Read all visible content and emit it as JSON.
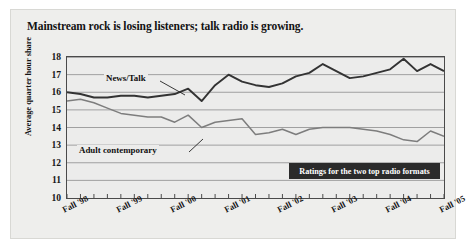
{
  "figure": {
    "title": "Mainstream rock is losing listeners; talk radio is growing.",
    "caption": "Ratings for the two top radio formats"
  },
  "chart_data": {
    "type": "line",
    "title": "Mainstream rock is losing listeners; talk radio is growing.",
    "xlabel": "",
    "ylabel": "Average quarter hour share",
    "ylim": [
      10,
      18
    ],
    "yticks": [
      10,
      11,
      12,
      13,
      14,
      15,
      16,
      17,
      18
    ],
    "grid": true,
    "legend_position": "inline-annotations",
    "annotation": "Ratings for the two top radio formats",
    "x_tick_labels": [
      "Fall '98",
      "Fall '99",
      "Fall '00",
      "Fall '01",
      "Fall '02",
      "Fall '03",
      "Fall '04",
      "Fall '05"
    ],
    "x_label_indices": [
      0,
      4,
      8,
      12,
      16,
      20,
      24,
      28
    ],
    "n_points": 29,
    "series": [
      {
        "name": "News/Talk",
        "color": "#333333",
        "values": [
          16.0,
          15.9,
          15.7,
          15.7,
          15.8,
          15.8,
          15.7,
          15.8,
          15.9,
          16.2,
          15.5,
          16.4,
          17.0,
          16.6,
          16.4,
          16.3,
          16.5,
          16.9,
          17.1,
          17.6,
          17.2,
          16.8,
          16.9,
          17.1,
          17.3,
          17.9,
          17.2,
          17.6,
          17.2
        ]
      },
      {
        "name": "Adult contemporary",
        "color": "#7d7d7d",
        "values": [
          15.5,
          15.6,
          15.4,
          15.1,
          14.8,
          14.7,
          14.6,
          14.6,
          14.3,
          14.7,
          14.0,
          14.3,
          14.4,
          14.5,
          13.6,
          13.7,
          13.9,
          13.6,
          13.9,
          14.0,
          14.0,
          14.0,
          13.9,
          13.8,
          13.6,
          13.3,
          13.2,
          13.8,
          13.5
        ]
      }
    ]
  }
}
